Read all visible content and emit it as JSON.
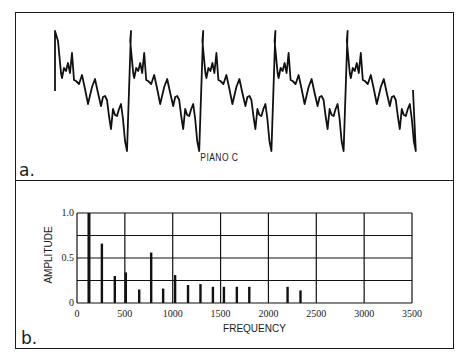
{
  "panel_a": {
    "letter": "a.",
    "caption": "PIANO C",
    "waveform": {
      "description": "Periodic piano waveform, 5 cycles",
      "cycles": 5
    }
  },
  "panel_b": {
    "letter": "b."
  },
  "chart_data": [
    {
      "type": "line",
      "title": "PIANO C",
      "panel": "a",
      "description": "Time-domain waveform of piano note C showing ~5 repeating periods; each period has a sharp positive peak, a cluster of small oscillations, a descending damped ripple, and a deep negative trough before the next peak.",
      "xlabel": "",
      "ylabel": "",
      "grid": false,
      "periods": 5
    },
    {
      "type": "bar",
      "panel": "b",
      "title": "",
      "xlabel": "FREQUENCY",
      "ylabel": "AMPLITUDE",
      "xlim": [
        0,
        3500
      ],
      "ylim": [
        0,
        1.0
      ],
      "xticks": [
        0,
        500,
        1000,
        1500,
        2000,
        2500,
        3000,
        3500
      ],
      "yticks": [
        0,
        0.5,
        1.0
      ],
      "ytick_labels": [
        "0",
        "0.5",
        "1.0"
      ],
      "grid": true,
      "grid_y": [
        0.25,
        0.5,
        0.75,
        1.0
      ],
      "x": [
        125,
        260,
        395,
        510,
        650,
        775,
        900,
        1025,
        1160,
        1290,
        1420,
        1535,
        1670,
        1800,
        2200,
        2335
      ],
      "values": [
        1.0,
        0.66,
        0.3,
        0.34,
        0.15,
        0.56,
        0.16,
        0.31,
        0.2,
        0.21,
        0.18,
        0.18,
        0.18,
        0.18,
        0.18,
        0.14
      ]
    }
  ]
}
